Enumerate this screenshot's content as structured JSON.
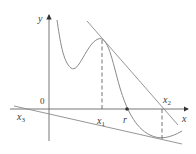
{
  "figure": {
    "axes": {
      "x_label": "x",
      "y_label": "y",
      "origin_label": "0"
    },
    "points": {
      "x1": "x",
      "x1_sub": "1",
      "x2": "x",
      "x2_sub": "2",
      "x3": "x",
      "x3_sub": "3",
      "root": "r"
    },
    "colors": {
      "curve": "#8a8a8a",
      "axis": "#555555",
      "text": "#3a3a3a"
    }
  }
}
